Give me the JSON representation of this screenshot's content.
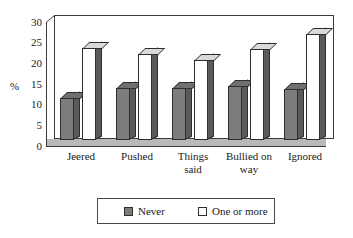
{
  "chart_data": {
    "type": "bar",
    "title": "",
    "subtitle": "",
    "xlabel": "",
    "ylabel": "%",
    "ylim": [
      0,
      30
    ],
    "yticks": [
      0,
      5,
      10,
      15,
      20,
      25,
      30
    ],
    "ytick_labels": [
      "0",
      "5",
      "10",
      "15",
      "20",
      "25",
      "30"
    ],
    "grid": false,
    "legend_position": "bottom",
    "categories": [
      "Jeered",
      "Pushed",
      "Things said",
      "Bullied on way",
      "Ignored"
    ],
    "category_lines": [
      [
        "Jeered"
      ],
      [
        "Pushed"
      ],
      [
        "Things",
        "said"
      ],
      [
        "Bullied on",
        "way"
      ],
      [
        "Ignored"
      ]
    ],
    "series": [
      {
        "name": "Never",
        "color": "#7c7c7c",
        "values": [
          10,
          12.3,
          12.3,
          12.8,
          12.2
        ]
      },
      {
        "name": "One or more",
        "color": "#ffffff",
        "values": [
          22,
          20.5,
          19,
          21.8,
          25.5
        ]
      }
    ]
  },
  "legend": {
    "items": [
      {
        "label": "Never",
        "swatch": "filled-gray-swatch"
      },
      {
        "label": "One or more",
        "swatch": "outline-white-swatch"
      }
    ]
  },
  "axis": {
    "y_title": "%"
  }
}
